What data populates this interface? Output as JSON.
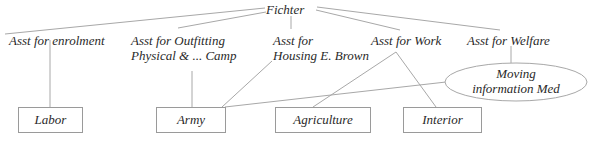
{
  "diagram": {
    "root": {
      "label": "Fichter"
    },
    "assistants": [
      {
        "id": "enrolment",
        "line1": "Asst for enrolment",
        "line2": ""
      },
      {
        "id": "outfitting",
        "line1": "Asst for Outfitting",
        "line2": "Physical & ... Camp"
      },
      {
        "id": "housing",
        "line1": "Asst for",
        "line2": "Housing E. Brown"
      },
      {
        "id": "work",
        "line1": "Asst for Work",
        "line2": ""
      },
      {
        "id": "welfare",
        "line1": "Asst for Welfare",
        "line2": ""
      }
    ],
    "ellipse": {
      "line1": "Moving",
      "line2": "information Med"
    },
    "agencies": [
      {
        "id": "labor",
        "label": "Labor"
      },
      {
        "id": "army",
        "label": "Army"
      },
      {
        "id": "agriculture",
        "label": "Agriculture"
      },
      {
        "id": "interior",
        "label": "Interior"
      }
    ],
    "edges": [
      [
        "Fichter",
        "Asst for enrolment"
      ],
      [
        "Fichter",
        "Asst for Outfitting"
      ],
      [
        "Fichter",
        "Asst for Housing"
      ],
      [
        "Fichter",
        "Asst for Work"
      ],
      [
        "Fichter",
        "Asst for Welfare"
      ],
      [
        "Asst for enrolment",
        "Labor"
      ],
      [
        "Asst for Outfitting",
        "Army"
      ],
      [
        "Asst for Housing",
        "Army"
      ],
      [
        "Asst for Work",
        "Agriculture"
      ],
      [
        "Asst for Work",
        "Interior"
      ],
      [
        "Asst for Welfare",
        "Moving information Med"
      ],
      [
        "Moving information Med",
        "Army"
      ]
    ],
    "line_color": "#a8a8a8"
  }
}
